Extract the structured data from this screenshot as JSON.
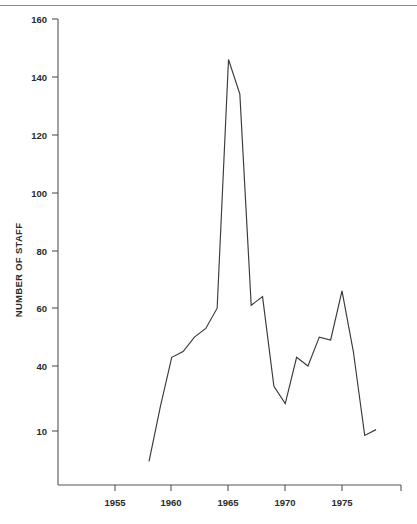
{
  "figure": {
    "background_color": "#ffffff",
    "line_color": "#3a3a3a",
    "axis_color": "#555555",
    "text_color": "#2b2b2b",
    "top_rule_color": "#8a8a8a"
  },
  "chart_data": {
    "type": "line",
    "title": "",
    "subtitle": "",
    "xlabel": "",
    "ylabel": "NUMBER OF STAFF",
    "grid": false,
    "legend": null,
    "legend_position": "none",
    "xlim": [
      1953.2,
      1978.4
    ],
    "ylim": [
      0,
      167
    ],
    "x_ticks": [
      1955,
      1960,
      1965,
      1970,
      1975
    ],
    "x_tick_labels": [
      "1955",
      "1960",
      "1965",
      "1970",
      "1975"
    ],
    "y_ticks": [
      10,
      40,
      60,
      80,
      100,
      120,
      140,
      160
    ],
    "y_tick_labels": [
      "10",
      "40",
      "60",
      "80",
      "100",
      "120",
      "140",
      "160"
    ],
    "series": [
      {
        "name": "Number of staff",
        "x": [
          1958,
          1959,
          1960,
          1961,
          1962,
          1963,
          1964,
          1965,
          1966,
          1967,
          1968,
          1969,
          1970,
          1971,
          1972,
          1973,
          1974,
          1975,
          1976,
          1977,
          1978
        ],
        "values": [
          7,
          26,
          43,
          45,
          50,
          53,
          60,
          146,
          134,
          61,
          64,
          33,
          27,
          43,
          40,
          50,
          49,
          66,
          45,
          16,
          18
        ]
      }
    ],
    "annotations": []
  }
}
